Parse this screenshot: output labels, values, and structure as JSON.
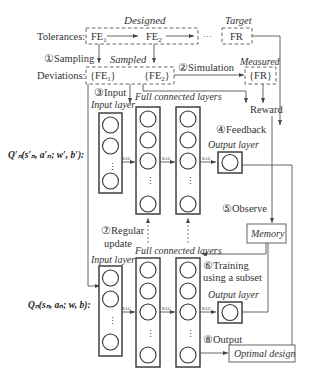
{
  "top": {
    "designed_label": "Designed",
    "target_label": "Target",
    "tolerances_label": "Tolerances:",
    "fe1": "FE",
    "fe1_sub": "1",
    "fe2": "FE",
    "fe2_sub": "2",
    "ellipsis": "···",
    "fr": "FR",
    "sampling_label": "①Sampling",
    "sampled_label": "Sampled",
    "measured_label": "Measured",
    "deviations_label": "Deviations:",
    "dev_fe1": "{FE",
    "dev_fe1_sub": "1",
    "dev_fe1_close": "}",
    "dev_fe2": "{FE",
    "dev_fe2_sub": "2",
    "dev_fe2_close": "}",
    "simulation_label": "②Simulation",
    "dev_fr": "{FR}",
    "reward_label": "Reward"
  },
  "target_net": {
    "input_step": "③Input",
    "input_layer_label": "Input layer",
    "fc_label": "Full connected layers",
    "feedback_label": "④Feedback",
    "output_layer_label": "Output layer",
    "q_formula": "Q′ₙ(s′ₙ, a′ₙ; w′, b′):",
    "activation_labels": [
      "ReLU",
      "ReLU",
      "ReLU"
    ],
    "vdots": "⋮"
  },
  "middle": {
    "observe_label": "⑤Observe",
    "memory_label": "Memory",
    "regular_update_line1": "⑦Regular",
    "regular_update_line2": "update",
    "training_line1": "⑥Training",
    "training_line2": "using a subset"
  },
  "main_net": {
    "input_layer_label": "Input layer",
    "fc_label": "Full connected layers",
    "output_layer_label": "Output layer",
    "q_formula": "Qₙ(sₙ, aₙ; w, b):",
    "activation_labels": [
      "ReLU",
      "ReLU",
      "ReLU"
    ],
    "output_step": "⑧Output",
    "optimal_design_label": "Optimal design",
    "vdots": "⋮"
  }
}
